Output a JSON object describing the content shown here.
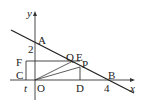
{
  "diagram": {
    "type": "coordinate-geometry",
    "axes": {
      "x_label": "x",
      "y_label": "y"
    },
    "points": {
      "A": "A",
      "B": "B",
      "C": "C",
      "D": "D",
      "E": "E",
      "F": "F",
      "P": "P",
      "Q": "Q",
      "O": "O"
    },
    "ticks": {
      "y_intercept": "2",
      "x_intercept": "4",
      "t": "t"
    }
  }
}
